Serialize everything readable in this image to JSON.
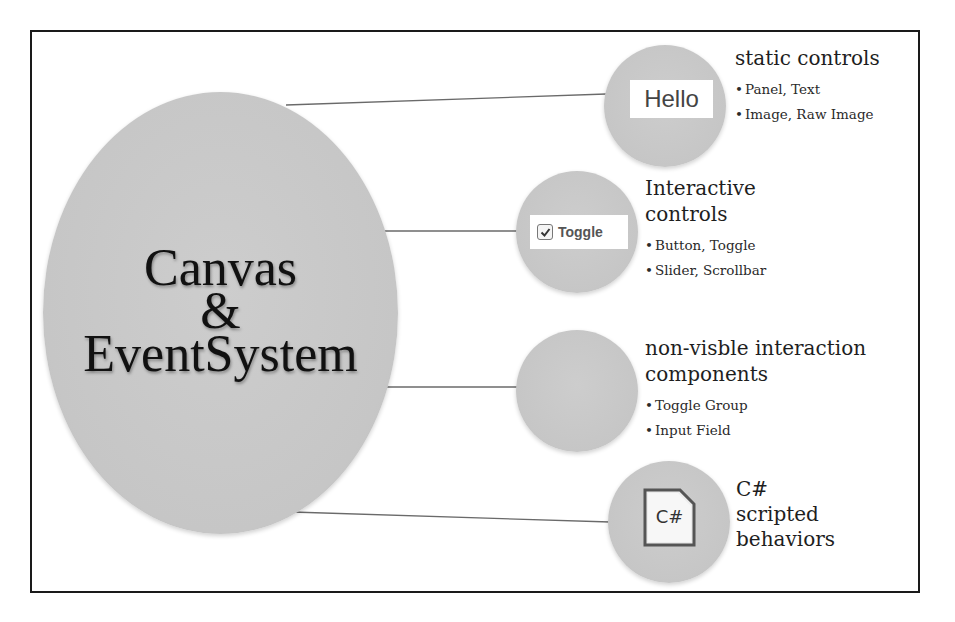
{
  "diagram": {
    "center": {
      "lines": [
        "Canvas",
        "&",
        "EventSystem"
      ]
    },
    "nodes": [
      {
        "icon": "hello-text-icon",
        "icon_text": "Hello",
        "title_lines": [
          "static controls"
        ],
        "bullets": [
          "Panel, Text",
          "Image, Raw Image"
        ]
      },
      {
        "icon": "toggle-checkbox-icon",
        "icon_text": "Toggle",
        "title_lines": [
          "Interactive",
          "controls"
        ],
        "bullets": [
          "Button, Toggle",
          "Slider, Scrollbar"
        ]
      },
      {
        "icon": null,
        "title_lines": [
          "non-visble interaction",
          "components"
        ],
        "bullets": [
          "Toggle Group",
          "Input Field"
        ]
      },
      {
        "icon": "csharp-file-icon",
        "icon_text": "C#",
        "title_lines": [
          "C#",
          "scripted",
          "behaviors"
        ],
        "bullets": []
      }
    ],
    "colors": {
      "node_fill": "#c6c6c6",
      "border": "#1a1a1a",
      "connector": "#666666",
      "text": "#1e1e1e"
    }
  }
}
